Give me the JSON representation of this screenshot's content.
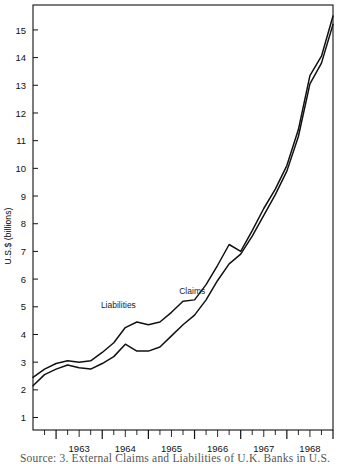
{
  "figure": {
    "caption": "Source: 3. External Claims and Liabilities of U.K. Banks in U.S.",
    "ylabel": "U.S.$ (billions)"
  },
  "chart_data": {
    "type": "line",
    "title": "",
    "xlabel": "",
    "ylabel": "U.S.$ (billions)",
    "xlim": [
      1962.5,
      1969.0
    ],
    "ylim": [
      0.55,
      15.9
    ],
    "yticks": [
      1,
      2,
      3,
      4,
      5,
      6,
      7,
      8,
      9,
      10,
      11,
      12,
      13,
      14,
      15
    ],
    "ytick_labels": [
      "1",
      "2",
      "3",
      "4",
      "5",
      "6",
      "7",
      "8",
      "9",
      "10",
      "11",
      "12",
      "13",
      "14",
      "15"
    ],
    "xticks": [
      1963,
      1964,
      1965,
      1966,
      1967,
      1968
    ],
    "xtick_labels": [
      "1963",
      "1964",
      "1965",
      "1966",
      "1967",
      "1968"
    ],
    "minor_xticks_per_year": 4,
    "grid": false,
    "legend": "inline-annotations",
    "annotations": [
      {
        "text": "Liabilities",
        "x": 1964.35,
        "y": 4.95
      },
      {
        "text": "Claims",
        "x": 1965.95,
        "y": 5.45
      }
    ],
    "x": [
      1962.5,
      1962.75,
      1963.0,
      1963.25,
      1963.5,
      1963.75,
      1964.0,
      1964.25,
      1964.5,
      1964.75,
      1965.0,
      1965.25,
      1965.5,
      1965.75,
      1966.0,
      1966.25,
      1966.5,
      1966.75,
      1967.0,
      1967.25,
      1967.5,
      1967.75,
      1968.0,
      1968.25,
      1968.5,
      1968.75,
      1969.0
    ],
    "series": [
      {
        "name": "Liabilities",
        "color": "#111111",
        "values": [
          2.45,
          2.75,
          2.95,
          3.05,
          3.0,
          3.05,
          3.35,
          3.7,
          4.25,
          4.45,
          4.35,
          4.45,
          4.8,
          5.2,
          5.25,
          5.8,
          6.5,
          7.25,
          7.0,
          7.75,
          8.55,
          9.25,
          10.1,
          11.4,
          13.35,
          14.05,
          15.5
        ]
      },
      {
        "name": "Claims",
        "color": "#111111",
        "values": [
          2.15,
          2.55,
          2.75,
          2.9,
          2.8,
          2.75,
          2.95,
          3.2,
          3.65,
          3.4,
          3.4,
          3.55,
          3.95,
          4.35,
          4.7,
          5.25,
          5.95,
          6.55,
          6.9,
          7.55,
          8.3,
          9.05,
          9.9,
          11.15,
          13.05,
          13.8,
          15.2
        ]
      }
    ]
  }
}
